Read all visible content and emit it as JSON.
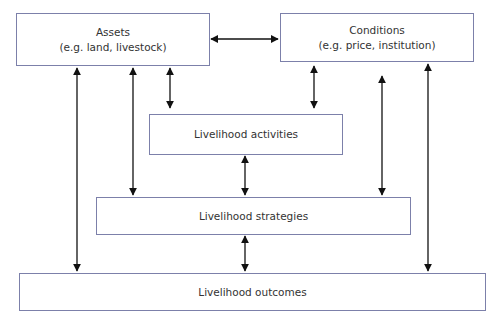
{
  "diagram": {
    "nodes": {
      "assets": {
        "title": "Assets",
        "subtitle": "(e.g. land, livestock)"
      },
      "conditions": {
        "title": "Conditions",
        "subtitle": "(e.g. price, institution)"
      },
      "activities": {
        "title": "Livelihood activities"
      },
      "strategies": {
        "title": "Livelihood strategies"
      },
      "outcomes": {
        "title": "Livelihood outcomes"
      }
    },
    "edges": [
      {
        "from": "assets",
        "to": "conditions",
        "direction": "bidirectional"
      },
      {
        "from": "assets",
        "to": "activities",
        "direction": "bidirectional"
      },
      {
        "from": "assets",
        "to": "strategies",
        "direction": "bidirectional"
      },
      {
        "from": "assets",
        "to": "outcomes",
        "direction": "bidirectional"
      },
      {
        "from": "conditions",
        "to": "activities",
        "direction": "bidirectional"
      },
      {
        "from": "conditions",
        "to": "strategies",
        "direction": "bidirectional"
      },
      {
        "from": "conditions",
        "to": "outcomes",
        "direction": "bidirectional"
      },
      {
        "from": "activities",
        "to": "strategies",
        "direction": "bidirectional"
      },
      {
        "from": "strategies",
        "to": "outcomes",
        "direction": "bidirectional"
      }
    ],
    "colors": {
      "box_border": "#7c80aa",
      "arrow": "#111111",
      "text": "#333333"
    }
  }
}
